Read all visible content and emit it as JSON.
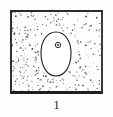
{
  "figure": {
    "caption_label": "1",
    "panel": {
      "frame_color": "#262626",
      "background_color": "#fdfdfd",
      "width_px": 93,
      "height_px": 84,
      "texture": {
        "name": "stipple-dots",
        "description": "random fine dark stipple dots filling the panel outside the oval",
        "dot_color": "#555555",
        "dot_count": 300,
        "density_note": "denser toward the left and lower-left, sparser toward the upper right"
      },
      "shapes": [
        {
          "name": "oval-cell-outline",
          "type": "egg-oval",
          "stroke_color": "#1f1f1f",
          "fill_color": "#ffffff",
          "center_x": 44,
          "center_y": 42,
          "radius_x": 15,
          "radius_y": 22
        },
        {
          "name": "nucleus-circle",
          "type": "circle",
          "stroke_color": "#2a2a2a",
          "fill_color": "#3a3a3a",
          "center_x": 46,
          "center_y": 33,
          "radius": 2.6
        }
      ]
    }
  }
}
